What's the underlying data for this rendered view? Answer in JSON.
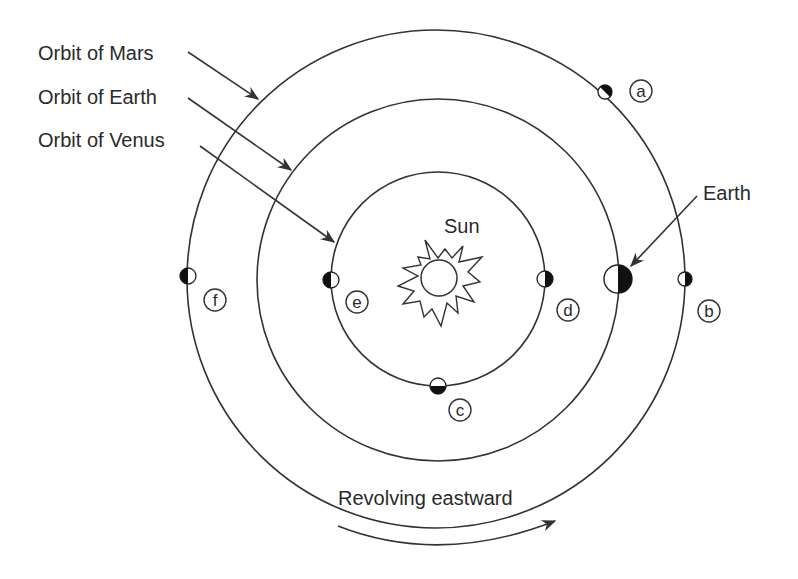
{
  "labels": {
    "orbit_mars": "Orbit of Mars",
    "orbit_earth": "Orbit of Earth",
    "orbit_venus": "Orbit of Venus",
    "sun": "Sun",
    "earth": "Earth",
    "revolving": "Revolving eastward"
  },
  "orbits": [
    {
      "name": "Venus",
      "cx": 438,
      "cy": 279,
      "r": 107
    },
    {
      "name": "Earth",
      "cx": 438,
      "cy": 280,
      "r": 181
    },
    {
      "name": "Mars",
      "cx": 436,
      "cy": 279,
      "r": 249
    }
  ],
  "positions": [
    {
      "id": "a",
      "orbit": "Mars",
      "marker": {
        "x": 605,
        "y": 92,
        "r": 7,
        "dark_side": "upper-right"
      },
      "label_pos": {
        "x": 641,
        "y": 91
      }
    },
    {
      "id": "b",
      "orbit": "Mars",
      "marker": {
        "x": 685,
        "y": 279,
        "r": 7,
        "dark_side": "right"
      },
      "label_pos": {
        "x": 709,
        "y": 311
      }
    },
    {
      "id": "c",
      "orbit": "Venus",
      "marker": {
        "x": 438,
        "y": 386,
        "r": 8,
        "dark_side": "bottom"
      },
      "label_pos": {
        "x": 460,
        "y": 410
      }
    },
    {
      "id": "d",
      "orbit": "Venus",
      "marker": {
        "x": 545,
        "y": 279,
        "r": 8,
        "dark_side": "right"
      },
      "label_pos": {
        "x": 568,
        "y": 310
      }
    },
    {
      "id": "e",
      "orbit": "Venus",
      "marker": {
        "x": 331,
        "y": 280,
        "r": 8,
        "dark_side": "left"
      },
      "label_pos": {
        "x": 357,
        "y": 302
      }
    },
    {
      "id": "f",
      "orbit": "Mars",
      "marker": {
        "x": 188,
        "y": 276,
        "r": 8,
        "dark_side": "left"
      },
      "label_pos": {
        "x": 215,
        "y": 300
      }
    }
  ],
  "earth_marker": {
    "x": 618,
    "y": 279,
    "r": 14,
    "dark_side": "right"
  },
  "sun": {
    "x": 439,
    "y": 278,
    "r": 18
  },
  "colors": {
    "line": "#333333",
    "fill_dark": "#111111",
    "background": "#ffffff"
  }
}
